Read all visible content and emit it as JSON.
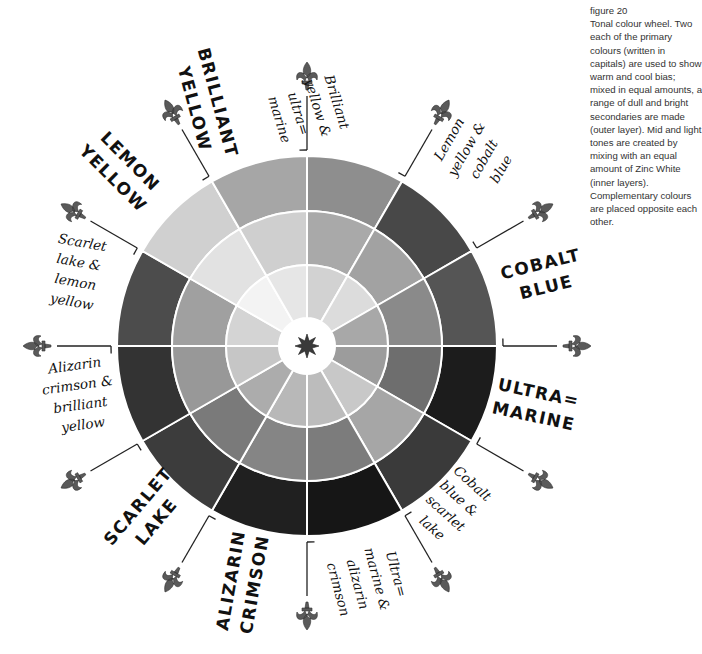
{
  "caption": {
    "figure": "figure 20",
    "text": "Tonal colour wheel. Two each of the primary colours (written in capitals) are used to show warm and cool bias; mixed in equal amounts, a range of dull and bright secondaries are made (outer layer). Mid and light tones are created by mixing with an equal amount of Zinc White (inner layers). Complementary colours are placed opposite each other."
  },
  "wheel": {
    "center": [
      307,
      346
    ],
    "radii": {
      "outer": 190,
      "mid": 135,
      "inner": 81,
      "hub": 28
    },
    "divider_color": "#ffffff",
    "segments": [
      {
        "name": "Brilliant yellow & ultramarine",
        "start": -90,
        "colors": [
          "#8e8e8e",
          "#a9a9a9",
          "#d2d2d2"
        ]
      },
      {
        "name": "Lemon yellow & cobalt blue",
        "start": -60,
        "colors": [
          "#484848",
          "#a2a2a2",
          "#dcdcdc"
        ]
      },
      {
        "name": "COBALT BLUE",
        "start": -30,
        "colors": [
          "#555555",
          "#8a8a8a",
          "#a8a8a8"
        ]
      },
      {
        "name": "ULTRAMARINE",
        "start": 0,
        "colors": [
          "#1c1c1c",
          "#6e6e6e",
          "#9c9c9c"
        ]
      },
      {
        "name": "Cobalt blue & scarlet lake",
        "start": 30,
        "colors": [
          "#3a3a3a",
          "#a6a6a6",
          "#c8c8c8"
        ]
      },
      {
        "name": "Ultramarine & alizarin crimson",
        "start": 60,
        "colors": [
          "#161616",
          "#7c7c7c",
          "#bcbcbc"
        ]
      },
      {
        "name": "ALIZARIN CRIMSON",
        "start": 90,
        "colors": [
          "#202020",
          "#858585",
          "#b8b8b8"
        ]
      },
      {
        "name": "SCARLET LAKE",
        "start": 120,
        "colors": [
          "#3c3c3c",
          "#7a7a7a",
          "#acacac"
        ]
      },
      {
        "name": "Alizarin crimson & brilliant yellow",
        "start": 150,
        "colors": [
          "#333333",
          "#989898",
          "#c6c6c6"
        ]
      },
      {
        "name": "Scarlet lake & lemon yellow",
        "start": 180,
        "colors": [
          "#4c4c4c",
          "#a0a0a0",
          "#d4d4d4"
        ]
      },
      {
        "name": "LEMON YELLOW",
        "start": 210,
        "colors": [
          "#d0d0d0",
          "#e2e2e2",
          "#f3f3f3"
        ]
      },
      {
        "name": "BRILLIANT YELLOW",
        "start": 240,
        "colors": [
          "#a6a6a6",
          "#cfcfcf",
          "#e6e6e6"
        ]
      }
    ],
    "hub_icon": "eight-point-star-icon",
    "hub_color": "#3a3a3a"
  },
  "pointers": {
    "icon": "fleur-de-lis-icon",
    "color": "#5a5a5a",
    "angles": [
      -90,
      -60,
      -30,
      0,
      30,
      60,
      90,
      120,
      150,
      180,
      210,
      240
    ],
    "inner_r": 196,
    "outer_r": 268
  },
  "labels": [
    {
      "id": "brilliant-yellow",
      "type": "caps",
      "text": "BRILLIANT\nYELLOW",
      "x": 215,
      "y": 45,
      "rot": 75
    },
    {
      "id": "lemon-yellow",
      "type": "caps",
      "text": "LEMON\nYELLOW",
      "x": 108,
      "y": 122,
      "rot": 45
    },
    {
      "id": "brilliant-yellow-ultramarine",
      "type": "mix",
      "text": "Brilliant\nyellow &\nultra=\nmarine",
      "x": 338,
      "y": 70,
      "rot": 73
    },
    {
      "id": "lemon-yellow-cobalt-blue",
      "type": "mix",
      "text": "Lemon\nyellow &\ncobalt\nblue",
      "x": 425,
      "y": 160,
      "rot": -60
    },
    {
      "id": "cobalt-blue",
      "type": "caps",
      "text": "COBALT\nBLUE",
      "x": 498,
      "y": 262,
      "rot": -14
    },
    {
      "id": "ultramarine",
      "type": "caps",
      "text": "ULTRA=\nMARINE",
      "x": 500,
      "y": 372,
      "rot": 12
    },
    {
      "id": "cobalt-blue-scarlet-lake",
      "type": "mix",
      "text": "Cobalt\nblue &\nscarlet\nlake",
      "x": 462,
      "y": 460,
      "rot": 42
    },
    {
      "id": "ultramarine-alizarin-crimson",
      "type": "mix",
      "text": "Ultra=\nmarine &\nalizarin\ncrimson",
      "x": 398,
      "y": 540,
      "rot": 75
    },
    {
      "id": "alizarin-crimson",
      "type": "caps",
      "text": "ALIZARIN\nCRIMSON",
      "x": 210,
      "y": 628,
      "rot": -80
    },
    {
      "id": "scarlet-lake",
      "type": "caps",
      "text": "SCARLET\nLAKE",
      "x": 98,
      "y": 535,
      "rot": -50
    },
    {
      "id": "alizarin-crimson-brilliant-yellow",
      "type": "mix",
      "text": "Alizarin\ncrimson &\nbrilliant\nyellow",
      "x": 38,
      "y": 360,
      "rot": -8
    },
    {
      "id": "scarlet-lake-lemon-yellow",
      "type": "mix",
      "text": "Scarlet\nlake &\nlemon\nyellow",
      "x": 60,
      "y": 228,
      "rot": 10
    }
  ]
}
